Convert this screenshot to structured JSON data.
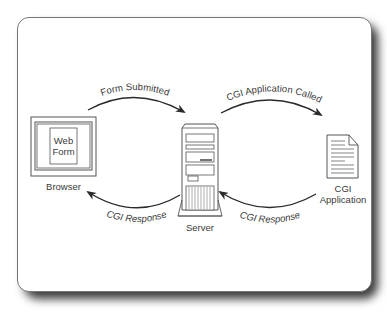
{
  "diagram": {
    "nodes": {
      "browser": {
        "label": "Browser",
        "inner_label_line1": "Web",
        "inner_label_line2": "Form"
      },
      "server": {
        "label": "Server"
      },
      "cgi_app": {
        "label_line1": "CGI",
        "label_line2": "Application"
      }
    },
    "edges": {
      "form_submitted": {
        "label": "Form Submitted",
        "from": "Browser",
        "to": "Server"
      },
      "cgi_called": {
        "label": "CGI Application Called",
        "from": "Server",
        "to": "CGI Application"
      },
      "response_to_browser": {
        "label": "CGI Response",
        "from": "Server",
        "to": "Browser"
      },
      "response_to_server": {
        "label": "CGI Response",
        "from": "CGI Application",
        "to": "Server"
      }
    },
    "colors": {
      "stroke": "#3a3a3a",
      "panel_border": "#777777",
      "shadow": "#3a3a3a"
    }
  }
}
